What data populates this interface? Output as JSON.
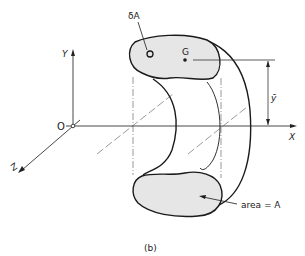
{
  "figure": {
    "caption": "(b)",
    "axes": {
      "x_label": "X",
      "y_label": "Y",
      "z_label": "Z",
      "origin_label": "O"
    },
    "labels": {
      "element_area": "δA",
      "centroid": "G",
      "centroid_height": "ȳ",
      "area": "area = A"
    },
    "colors": {
      "stroke": "#1a1a1a",
      "fill": "#e6e6e6",
      "thin_line": "#333333",
      "background": "#ffffff"
    }
  }
}
